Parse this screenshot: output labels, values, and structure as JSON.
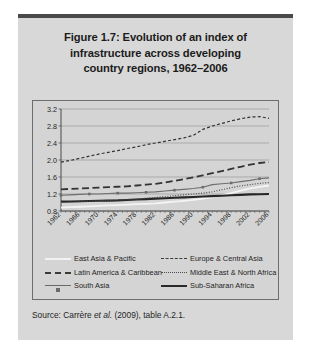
{
  "figure": {
    "title_lines": [
      "Figure 1.7:  Evolution of an index of",
      "infrastructure across developing",
      "country regions, 1962–2006"
    ],
    "source_prefix": "Source: Carrère ",
    "source_italic": "et al.",
    "source_suffix": " (2009), table A.2.1."
  },
  "colors": {
    "card_background": "#d8d8d8",
    "top_bar": "#4a4a4a",
    "plot_background": "#d4d4d4",
    "plot_border": "#6d6d6d",
    "gridline": "#9a9a9a",
    "text": "#1f1f1f"
  },
  "chart_data": {
    "type": "line",
    "title": "Figure 1.7:  Evolution of an index of infrastructure across developing country regions, 1962–2006",
    "xlabel": "",
    "ylabel": "",
    "ylim": [
      0.8,
      3.2
    ],
    "yticks": [
      "0.8",
      "1.2",
      "1.6",
      "2.0",
      "2.4",
      "2.8",
      "3.2"
    ],
    "xlim": [
      1962,
      2006
    ],
    "xticks": [
      "1962",
      "1966",
      "1970",
      "1974",
      "1978",
      "1982",
      "1986",
      "1990",
      "1994",
      "1998",
      "2002",
      "2006"
    ],
    "grid": "horizontal",
    "legend_position": "below-plot",
    "x": [
      1962,
      1964,
      1966,
      1968,
      1970,
      1972,
      1974,
      1976,
      1978,
      1980,
      1982,
      1984,
      1986,
      1988,
      1990,
      1992,
      1994,
      1996,
      1998,
      2000,
      2002,
      2004,
      2006
    ],
    "series": [
      {
        "name": "East Asia & Pacific",
        "style": "solid-white",
        "values": [
          0.88,
          0.89,
          0.9,
          0.91,
          0.92,
          0.93,
          0.94,
          0.95,
          0.96,
          0.97,
          0.98,
          1.0,
          1.02,
          1.04,
          1.06,
          1.09,
          1.12,
          1.17,
          1.22,
          1.28,
          1.33,
          1.37,
          1.4
        ]
      },
      {
        "name": "Europe & Central Asia",
        "style": "dash-short",
        "values": [
          1.95,
          1.99,
          2.04,
          2.09,
          2.14,
          2.18,
          2.22,
          2.27,
          2.31,
          2.36,
          2.4,
          2.44,
          2.48,
          2.52,
          2.58,
          2.72,
          2.8,
          2.86,
          2.92,
          2.97,
          3.01,
          3.02,
          2.98
        ]
      },
      {
        "name": "Latin America & Caribbean",
        "style": "dash-long",
        "values": [
          1.31,
          1.32,
          1.33,
          1.34,
          1.35,
          1.36,
          1.37,
          1.38,
          1.4,
          1.42,
          1.44,
          1.47,
          1.51,
          1.55,
          1.59,
          1.64,
          1.69,
          1.74,
          1.79,
          1.84,
          1.89,
          1.93,
          1.95
        ]
      },
      {
        "name": "Middle East & North Africa",
        "style": "dotted",
        "values": [
          1.0,
          1.01,
          1.02,
          1.03,
          1.04,
          1.05,
          1.06,
          1.07,
          1.08,
          1.1,
          1.12,
          1.14,
          1.16,
          1.18,
          1.2,
          1.22,
          1.25,
          1.3,
          1.35,
          1.39,
          1.42,
          1.45,
          1.47
        ]
      },
      {
        "name": "South Asia",
        "style": "line-marker",
        "values": [
          1.17,
          1.18,
          1.19,
          1.2,
          1.2,
          1.21,
          1.22,
          1.22,
          1.23,
          1.24,
          1.25,
          1.27,
          1.29,
          1.31,
          1.33,
          1.36,
          1.42,
          1.44,
          1.46,
          1.49,
          1.52,
          1.56,
          1.58
        ]
      },
      {
        "name": "Sub-Saharan Africa",
        "style": "solid-bold",
        "values": [
          1.02,
          1.025,
          1.03,
          1.035,
          1.04,
          1.045,
          1.05,
          1.06,
          1.07,
          1.08,
          1.09,
          1.1,
          1.11,
          1.12,
          1.13,
          1.14,
          1.15,
          1.16,
          1.17,
          1.18,
          1.19,
          1.195,
          1.2
        ]
      }
    ]
  },
  "legend": {
    "left": [
      {
        "label": "East Asia & Pacific",
        "swatch": "sw-solid-white"
      },
      {
        "label": "Latin America & Caribbean",
        "swatch": "sw-dash-long"
      },
      {
        "label": "South Asia",
        "swatch": "sw-marker"
      }
    ],
    "right": [
      {
        "label": "Europe & Central Asia",
        "swatch": "sw-dash-short"
      },
      {
        "label": "Middle East & North Africa",
        "swatch": "sw-dotted"
      },
      {
        "label": "Sub-Saharan Africa",
        "swatch": "sw-solid-bold"
      }
    ]
  }
}
